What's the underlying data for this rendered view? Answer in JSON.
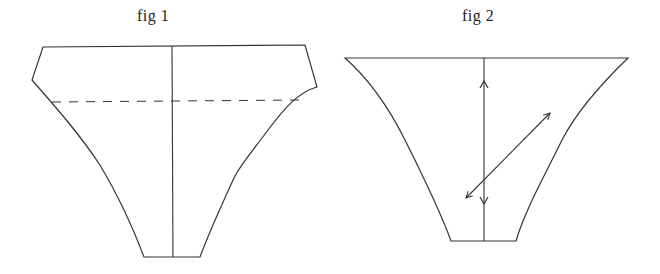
{
  "figures": [
    {
      "label": "fig 1",
      "shape": "trapezoidal pattern piece with notched upper corners, curved sides narrowing to a small flat bottom",
      "elements": [
        "outline",
        "vertical center line",
        "horizontal dashed line"
      ]
    },
    {
      "label": "fig 2",
      "shape": "flared trapezoidal pattern piece with wide straight top and concave curved sides narrowing to a small flat bottom",
      "elements": [
        "outline",
        "vertical double-headed arrow (grainline)",
        "diagonal double-headed arrow (bias)"
      ]
    }
  ],
  "colors": {
    "background": "#ffffff",
    "stroke": "#333333"
  }
}
